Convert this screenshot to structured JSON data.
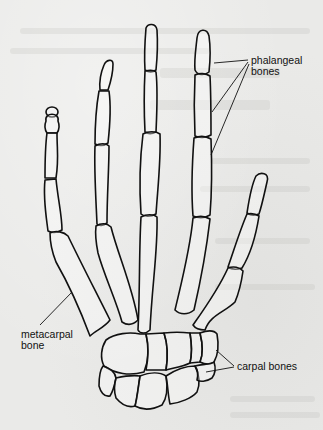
{
  "diagram": {
    "labels": {
      "phalangeal": {
        "line1": "phalangeal",
        "line2": "bones"
      },
      "metacarpal": {
        "line1": "metacarpal",
        "line2": "bone"
      },
      "carpal": {
        "line1": "carpal bones"
      }
    },
    "colors": {
      "line": "#111111",
      "background": "#eaeae8"
    }
  }
}
